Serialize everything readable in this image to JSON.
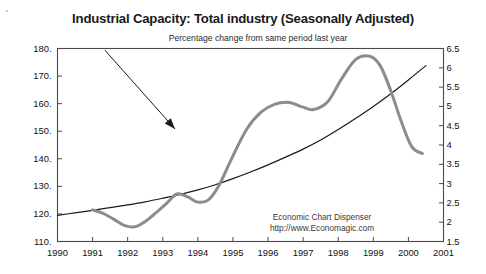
{
  "figure": {
    "title": "Industrial Capacity: Total industry (Seasonally Adjusted)",
    "subtitle": "Percentage change from same period last year",
    "credit_line1": "Economic Chart Dispenser",
    "credit_line2": "http://www.Economagic.com",
    "background_color": "#ffffff",
    "frame_color": "#4a4a4a"
  },
  "chart_data": {
    "type": "line",
    "title": "Industrial Capacity: Total industry (Seasonally Adjusted)",
    "subtitle": "Percentage change from same period last year",
    "xlabel": "",
    "ylabel": "",
    "xlim": [
      1990,
      2001
    ],
    "grid": false,
    "legend": "none",
    "annotations": [
      {
        "name": "subtitle-pointer-arrow",
        "text": "Percentage change from same period last year",
        "from_x": 1991.35,
        "from_y_left": 179.4,
        "to_x": 1993.35,
        "to_y_left": 150.8,
        "color": "#1a1a1a"
      }
    ],
    "axes": {
      "left": {
        "label": "Capacity Index",
        "lim": [
          110,
          180
        ],
        "ticks": [
          110,
          120,
          130,
          140,
          150,
          160,
          170,
          180
        ],
        "ticklabels": [
          "110.",
          "120.",
          "130.",
          "140.",
          "150.",
          "160.",
          "170.",
          "180."
        ]
      },
      "right": {
        "label": "Percent change",
        "lim": [
          1.5,
          6.5
        ],
        "ticks": [
          1.5,
          2,
          2.5,
          3,
          3.5,
          4,
          4.5,
          5,
          5.5,
          6,
          6.5
        ],
        "ticklabels": [
          "1.5",
          "2",
          "2.5",
          "3",
          "3.5",
          "4",
          "4.5",
          "5",
          "5.5",
          "6",
          "6.5"
        ]
      },
      "bottom": {
        "ticks": [
          1990,
          1991,
          1992,
          1993,
          1994,
          1995,
          1996,
          1997,
          1998,
          1999,
          2000,
          2001
        ],
        "ticklabels": [
          "1990",
          "1991",
          "1992",
          "1993",
          "1994",
          "1995",
          "1996",
          "1997",
          "1998",
          "1999",
          "2000",
          "2001"
        ]
      }
    },
    "series": [
      {
        "name": "Industrial Capacity Index (level)",
        "axis": "left",
        "color": "#1a1a1a",
        "width": 1.2,
        "x": [
          1990.0,
          1990.5,
          1991.0,
          1991.5,
          1992.0,
          1992.5,
          1993.0,
          1993.5,
          1994.0,
          1994.5,
          1995.0,
          1995.5,
          1996.0,
          1996.5,
          1997.0,
          1997.5,
          1998.0,
          1998.5,
          1999.0,
          1999.5,
          2000.0,
          2000.5
        ],
        "y": [
          119.5,
          120.4,
          121.3,
          122.3,
          123.3,
          124.4,
          125.7,
          127.1,
          128.7,
          130.6,
          132.8,
          135.2,
          137.8,
          140.6,
          143.5,
          146.8,
          150.6,
          154.7,
          159.0,
          163.6,
          168.6,
          173.8
        ]
      },
      {
        "name": "Percentage change from same period last year",
        "axis": "right",
        "color": "#8c8c8c",
        "width": 3.0,
        "x": [
          1991.0,
          1991.3,
          1991.6,
          1991.9,
          1992.2,
          1992.5,
          1992.8,
          1993.1,
          1993.4,
          1993.7,
          1994.0,
          1994.3,
          1994.6,
          1995.0,
          1995.4,
          1995.8,
          1996.2,
          1996.6,
          1997.0,
          1997.3,
          1997.7,
          1998.1,
          1998.5,
          1998.9,
          1999.2,
          1999.5,
          1999.8,
          2000.1,
          2000.4
        ],
        "y": [
          2.32,
          2.23,
          2.08,
          1.92,
          1.88,
          2.02,
          2.24,
          2.48,
          2.73,
          2.66,
          2.52,
          2.58,
          2.95,
          3.72,
          4.42,
          4.85,
          5.06,
          5.1,
          4.98,
          4.92,
          5.12,
          5.72,
          6.22,
          6.3,
          6.05,
          5.4,
          4.6,
          3.95,
          3.78
        ]
      }
    ]
  }
}
